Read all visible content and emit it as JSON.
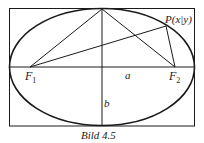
{
  "figure": {
    "caption": "Bild 4.5",
    "point_label": "P(x|y)",
    "focus1": {
      "base": "F",
      "sub": "1"
    },
    "focus2": {
      "base": "F",
      "sub": "2"
    },
    "semi_major_label": "a",
    "semi_minor_label": "b"
  },
  "colors": {
    "stroke": "#1a1a1a",
    "background": "#ffffff"
  }
}
